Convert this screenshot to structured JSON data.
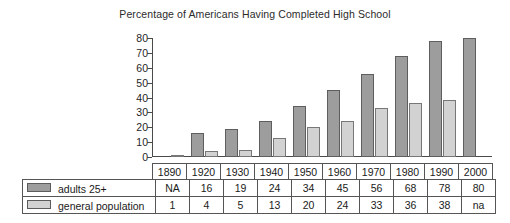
{
  "chart_data": {
    "type": "bar",
    "title": "Percentage of Americans Having Completed High School",
    "xlabel": "",
    "ylabel": "",
    "ylim": [
      0,
      80
    ],
    "yticks": [
      80,
      70,
      60,
      50,
      40,
      30,
      20,
      10,
      0
    ],
    "grid": false,
    "legend_position": "table-left",
    "categories": [
      "1890",
      "1920",
      "1930",
      "1940",
      "1950",
      "1960",
      "1970",
      "1980",
      "1990",
      "2000"
    ],
    "series": [
      {
        "name": "adults 25+",
        "color": "#9d9d9d",
        "values": [
          null,
          16,
          19,
          24,
          34,
          45,
          56,
          68,
          78,
          80
        ],
        "labels": [
          "NA",
          "16",
          "19",
          "24",
          "34",
          "45",
          "56",
          "68",
          "78",
          "80"
        ]
      },
      {
        "name": "general population",
        "color": "#d2d2d2",
        "values": [
          1,
          4,
          5,
          13,
          20,
          24,
          33,
          36,
          38,
          null
        ],
        "labels": [
          "1",
          "4",
          "5",
          "13",
          "20",
          "24",
          "33",
          "36",
          "38",
          "na"
        ]
      }
    ]
  },
  "table": {
    "year_header": [
      "1890",
      "1920",
      "1930",
      "1940",
      "1950",
      "1960",
      "1970",
      "1980",
      "1990",
      "2000"
    ],
    "rows": [
      {
        "label": "adults 25+",
        "swatch": "dark-gray-swatch",
        "values": [
          "NA",
          "16",
          "19",
          "24",
          "34",
          "45",
          "56",
          "68",
          "78",
          "80"
        ]
      },
      {
        "label": "general population",
        "swatch": "light-gray-swatch",
        "values": [
          "1",
          "4",
          "5",
          "13",
          "20",
          "24",
          "33",
          "36",
          "38",
          "na"
        ]
      }
    ]
  },
  "colors": {
    "adults_bar": "#9d9d9d",
    "general_bar": "#d2d2d2",
    "axis": "#4a4a4a",
    "grid_border": "#555555",
    "background": "#ffffff"
  }
}
